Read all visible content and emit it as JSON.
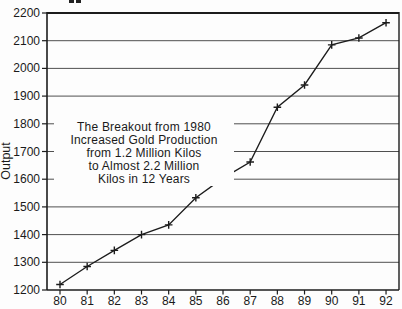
{
  "chart_data": {
    "type": "line",
    "title": "",
    "xlabel": "",
    "ylabel": "Output",
    "x_labels": [
      "80",
      "81",
      "82",
      "83",
      "84",
      "85",
      "86",
      "87",
      "88",
      "89",
      "90",
      "91",
      "92"
    ],
    "values": [
      1220,
      1285,
      1343,
      1400,
      1435,
      1533,
      1604,
      1662,
      1860,
      1940,
      2085,
      2110,
      2165
    ],
    "ylim": [
      1200,
      2200
    ],
    "yticks": [
      1200,
      1300,
      1400,
      1500,
      1600,
      1700,
      1800,
      1900,
      2000,
      2100,
      2200
    ],
    "grid": "horizontal",
    "legend": "none",
    "marker": "plus",
    "annotation": {
      "lines": [
        "The Breakout from 1980",
        "Increased Gold Production",
        "from 1.2 Million Kilos",
        "to Almost 2.2 Million",
        "Kilos in 12 Years"
      ]
    },
    "colors": {
      "line": "#1c1c1c",
      "grid": "#3c3c3c",
      "frame": "#1c1c1c",
      "text": "#1a1a1a",
      "background": "#fdfdfd"
    }
  }
}
